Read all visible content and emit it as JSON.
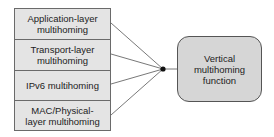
{
  "layers": [
    {
      "label": "Application-layer multihoming",
      "line1": "Application-layer",
      "line2": "multihoming"
    },
    {
      "label": "Transport-layer multihoming",
      "line1": "Transport-layer",
      "line2": "multihoming"
    },
    {
      "label": "IPv6 multihoming",
      "line1": "IPv6 multihoming",
      "line2": ""
    },
    {
      "label": "MAC/Physical-layer multihoming",
      "line1": "MAC/Physical-",
      "line2": "layer multihoming"
    }
  ],
  "function_box": {
    "line1": "Vertical",
    "line2": "multihoming",
    "line3": "function"
  },
  "colors": {
    "layer_fill": "#e4e4e4",
    "function_fill": "#d6d6d6",
    "line": "#555555"
  }
}
